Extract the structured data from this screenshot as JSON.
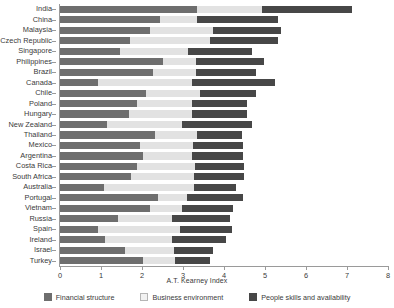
{
  "chart_data": {
    "type": "bar",
    "orientation": "horizontal",
    "stacked": true,
    "title": "",
    "xlabel": "A.T. Kearney Index",
    "ylabel": "",
    "xlim": [
      0,
      8
    ],
    "xticks": [
      0,
      1,
      2,
      3,
      4,
      5,
      6,
      7,
      8
    ],
    "xtick_labels": [
      "0",
      "1",
      "2",
      "3",
      "4",
      "5",
      "6",
      "7",
      "8"
    ],
    "grid": false,
    "legend_position": "bottom",
    "categories": [
      "India",
      "China",
      "Malaysia",
      "Czech Republic",
      "Singapore",
      "Philippines",
      "Brazil",
      "Canada",
      "Chile",
      "Poland",
      "Hungary",
      "New Zealand",
      "Thailand",
      "Mexico",
      "Argentina",
      "Costa Rica",
      "South Africa",
      "Australia",
      "Portugal",
      "Vietnam",
      "Russia",
      "Spain",
      "Ireland",
      "Israel",
      "Turkey"
    ],
    "series": [
      {
        "name": "Financial structure",
        "color": "#6e6e6e",
        "values": [
          3.34,
          2.45,
          2.19,
          1.7,
          1.46,
          2.52,
          2.26,
          0.92,
          2.1,
          1.88,
          1.68,
          1.15,
          2.32,
          1.95,
          2.02,
          1.88,
          1.74,
          1.08,
          2.4,
          2.2,
          1.42,
          0.92,
          1.1,
          1.58,
          2.02
        ]
      },
      {
        "name": "Business environment",
        "color": "#e2e2e2",
        "values": [
          1.59,
          0.9,
          1.54,
          1.95,
          1.65,
          0.8,
          1.05,
          2.3,
          1.32,
          1.35,
          1.55,
          1.83,
          1.03,
          1.3,
          1.2,
          1.42,
          1.52,
          2.2,
          0.7,
          0.77,
          1.32,
          2.0,
          1.64,
          1.2,
          0.78
        ]
      },
      {
        "name": "People skills and availability",
        "color": "#474747",
        "values": [
          2.19,
          1.97,
          1.67,
          1.66,
          1.58,
          1.65,
          1.48,
          2.03,
          1.35,
          1.34,
          1.32,
          1.7,
          1.1,
          1.22,
          1.24,
          1.2,
          1.22,
          1.02,
          1.36,
          1.24,
          1.4,
          1.27,
          1.3,
          0.95,
          0.87
        ]
      }
    ],
    "totals": [
      7.12,
      5.32,
      5.4,
      5.31,
      4.69,
      4.97,
      4.79,
      5.25,
      4.77,
      4.57,
      4.55,
      4.68,
      4.45,
      4.47,
      4.46,
      4.5,
      4.48,
      4.3,
      4.46,
      4.21,
      4.14,
      4.19,
      4.04,
      3.73,
      3.67
    ]
  },
  "legend": {
    "items": [
      {
        "label": "Financial structure"
      },
      {
        "label": "Business environment"
      },
      {
        "label": "People skills and availability"
      }
    ]
  }
}
